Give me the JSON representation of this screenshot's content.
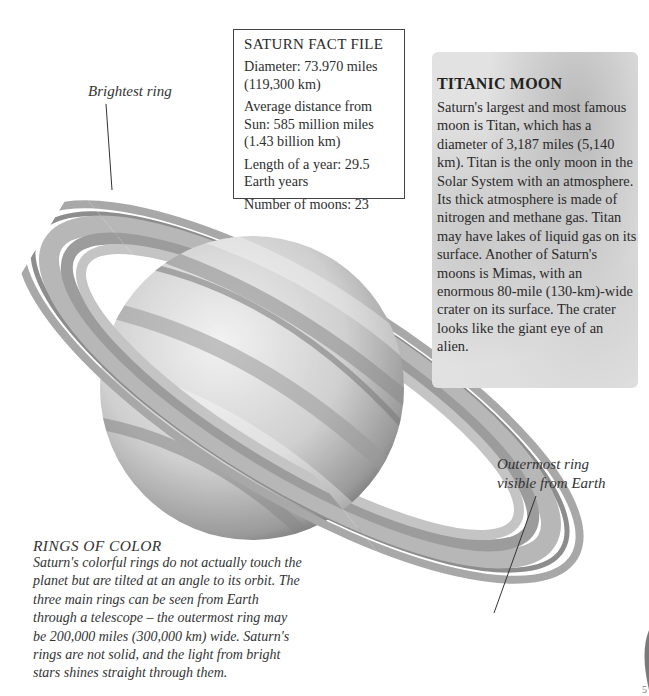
{
  "labels": {
    "brightest_ring": "Brightest ring",
    "outermost_ring_line1": "Outermost ring",
    "outermost_ring_line2": "visible from Earth"
  },
  "fact_file": {
    "title": "SATURN FACT FILE",
    "items": [
      "Diameter: 73.970 miles (119,300 km)",
      "Average distance from Sun: 585 million miles (1.43 billion km)",
      "Length of a year: 29.5 Earth years",
      "Number of moons: 23"
    ]
  },
  "titanic_moon": {
    "title": "TITANIC MOON",
    "body": "Saturn's largest and most famous moon is Titan, which has a diameter of 3,187 miles (5,140 km). Titan is the only moon in the Solar System with an atmosphere. Its thick atmosphere is made of nitrogen and methane gas. Titan may have lakes of liquid gas on its surface. Another of Saturn's moons is Mimas, with  an enormous 80-mile (130-km)-wide crater on its surface. The crater looks like the giant eye of an alien."
  },
  "rings_of_color": {
    "title": "RINGS OF COLOR",
    "body": "Saturn's colorful rings do not actually touch the planet but are tilted at an angle to its orbit. The three main rings can be seen from Earth through a telescope – the outermost ring may be 200,000 miles (300,000 km) wide. Saturn's rings are not solid, and the light from bright stars shines straight through them."
  },
  "page_number": "5",
  "colors": {
    "background": "#ffffff",
    "planet_light": "#e6e6e6",
    "planet_dark": "#6e6e6e",
    "ring": "#9a9a9a",
    "text": "#2a2a2a"
  }
}
